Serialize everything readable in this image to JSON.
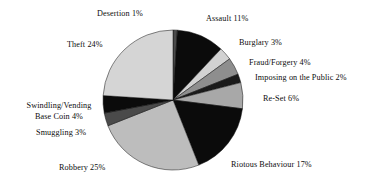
{
  "chart_data": {
    "type": "pie",
    "title": "",
    "subtitle": "",
    "xlabel": "",
    "ylabel": "",
    "legend_position": "none",
    "grid": false,
    "units": "percent",
    "start_angle_deg": 0,
    "direction": "clockwise",
    "categories": [
      "Desertion",
      "Assault",
      "Burglary",
      "Fraud/Forgery",
      "Imposing on the Public",
      "Re-Set",
      "Riotous Behaviour",
      "Robbery",
      "Smuggling",
      "Swindling/Vending Base Coin",
      "Theft"
    ],
    "values": [
      1,
      11,
      3,
      4,
      2,
      6,
      17,
      25,
      3,
      4,
      24
    ],
    "colors": [
      "#4a4a4a",
      "#0b0b0b",
      "#d2d2d2",
      "#8e8e8e",
      "#1a1a1a",
      "#a8a8a8",
      "#0b0b0b",
      "#bdbdbd",
      "#4a4a4a",
      "#0b0b0b",
      "#d5d5d5"
    ],
    "slices": [
      {
        "label": "Desertion",
        "value": 1,
        "value_text": "1%",
        "label_text": "Desertion 1%",
        "color": "#4a4a4a"
      },
      {
        "label": "Assault",
        "value": 11,
        "value_text": "11%",
        "label_text": "Assault 11%",
        "color": "#0b0b0b"
      },
      {
        "label": "Burglary",
        "value": 3,
        "value_text": "3%",
        "label_text": "Burglary 3%",
        "color": "#d2d2d2"
      },
      {
        "label": "Fraud/Forgery",
        "value": 4,
        "value_text": "4%",
        "label_text": "Fraud/Forgery 4%",
        "color": "#8e8e8e"
      },
      {
        "label": "Imposing on the Public",
        "value": 2,
        "value_text": "2%",
        "label_text": "Imposing on the Public 2%",
        "color": "#1a1a1a"
      },
      {
        "label": "Re-Set",
        "value": 6,
        "value_text": "6%",
        "label_text": "Re-Set 6%",
        "color": "#a8a8a8"
      },
      {
        "label": "Riotous Behaviour",
        "value": 17,
        "value_text": "17%",
        "label_text": "Riotous Behaviour 17%",
        "color": "#0b0b0b"
      },
      {
        "label": "Robbery",
        "value": 25,
        "value_text": "25%",
        "label_text": "Robbery 25%",
        "color": "#bdbdbd"
      },
      {
        "label": "Smuggling",
        "value": 3,
        "value_text": "3%",
        "label_text": "Smuggling 3%",
        "color": "#4a4a4a"
      },
      {
        "label": "Swindling/Vending Base Coin",
        "value": 4,
        "value_text": "4%",
        "label_text": "Swindling/Vending Base Coin 4%",
        "color": "#0b0b0b"
      },
      {
        "label": "Theft",
        "value": 24,
        "value_text": "24%",
        "label_text": "Theft 24%",
        "color": "#d5d5d5"
      }
    ]
  },
  "labels": {
    "desertion": "Desertion 1%",
    "assault": "Assault 11%",
    "burglary": "Burglary 3%",
    "fraud": "Fraud/Forgery 4%",
    "imposing": "Imposing on the Public 2%",
    "reset": "Re-Set 6%",
    "riotous": "Riotous Behaviour 17%",
    "robbery": "Robbery 25%",
    "smuggling": "Smuggling 3%",
    "swindling_line1": "Swindling/Vending",
    "swindling_line2": "Base Coin 4%",
    "theft": "Theft 24%"
  }
}
